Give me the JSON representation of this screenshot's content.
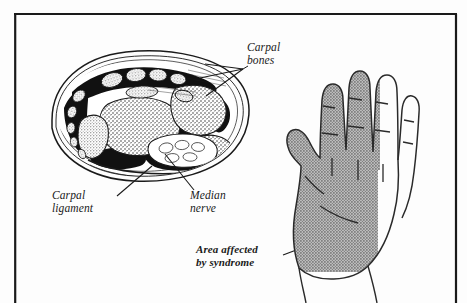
{
  "figure": {
    "kind": "anatomical-illustration",
    "background_color": "#fdfdfd",
    "ink_color": "#1a1a1a",
    "frame": {
      "name": "figure-border",
      "color": "#1a1a1a"
    }
  },
  "labels": {
    "carpal_bones": "Carpal\nbones",
    "carpal_ligament": "Carpal\nligament",
    "median_nerve": "Median\nnerve",
    "area_affected": "Area affected\nby syndrome"
  },
  "diagrams": {
    "cross_section": {
      "name": "wrist-cross-section",
      "description": "Transverse section through the carpal tunnel",
      "fill_color": "#ffffff",
      "outline_color": "#1a1a1a",
      "dark_structure_color": "#111111",
      "stipple_color": "#2b2b2b"
    },
    "hand": {
      "name": "palm-view-hand",
      "description": "Palmar view of the right hand",
      "outline_color": "#2a2a2a",
      "shaded_region_color": "#9a9a9a",
      "shaded_digits": [
        "thumb",
        "index",
        "middle",
        "ring-radial-half"
      ],
      "unshaded_digits": [
        "little",
        "ring-ulnar-half"
      ]
    }
  },
  "leader_lines": {
    "carpal_bones_count": 3,
    "carpal_ligament_count": 1,
    "median_nerve_count": 1,
    "area_affected_count": 1,
    "color": "#1a1a1a"
  }
}
